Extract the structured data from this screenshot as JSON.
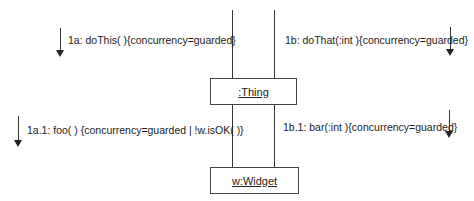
{
  "diagram": {
    "type": "UML collaboration diagram",
    "objects": [
      {
        "id": "thing",
        "label": ":Thing"
      },
      {
        "id": "widget",
        "label": "w:Widget"
      }
    ],
    "messages": [
      {
        "id": "m1a",
        "label": "1a: doThis( ){concurrency=guarded}",
        "direction": "down"
      },
      {
        "id": "m1b",
        "label": "1b: doThat(:int ){concurrency=guarded}",
        "direction": "down"
      },
      {
        "id": "m1a1",
        "label": "1a.1: foo( ) {concurrency=guarded | !w.isOK( )}",
        "direction": "down"
      },
      {
        "id": "m1b1",
        "label": "1b.1: bar(:int ){concurrency=guarded}",
        "direction": "down"
      }
    ]
  },
  "colors": {
    "line": "#333333",
    "text": "#222222",
    "background": "#ffffff"
  }
}
